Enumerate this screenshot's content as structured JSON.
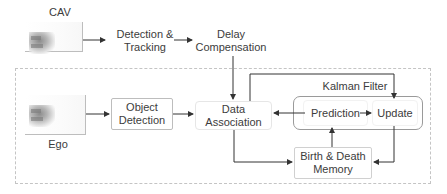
{
  "diagram": {
    "cav": {
      "label": "CAV",
      "image": "cav-point-cloud"
    },
    "ego": {
      "label": "Ego",
      "image": "ego-point-cloud"
    },
    "nodes": {
      "detection_tracking": "Detection &\nTracking",
      "delay_compensation": "Delay\nCompensation",
      "object_detection": "Object\nDetection",
      "data_association": "Data\nAssociation",
      "kalman_filter": "Kalman Filter",
      "prediction": "Prediction",
      "update": "Update",
      "birth_death_memory": "Birth & Death\nMemory"
    },
    "edges": [
      [
        "CAV",
        "Detection & Tracking"
      ],
      [
        "Detection & Tracking",
        "Delay Compensation"
      ],
      [
        "Delay Compensation",
        "Data Association"
      ],
      [
        "Ego",
        "Object Detection"
      ],
      [
        "Object Detection",
        "Data Association"
      ],
      [
        "Data Association",
        "Update"
      ],
      [
        "Prediction",
        "Data Association"
      ],
      [
        "Prediction",
        "Update"
      ],
      [
        "Data Association",
        "Birth & Death Memory"
      ],
      [
        "Update",
        "Birth & Death Memory"
      ],
      [
        "Birth & Death Memory",
        "Prediction"
      ]
    ],
    "colors": {
      "line": "#333333",
      "box_border": "#bdbdbd",
      "dashed_border": "#c4c4c4"
    }
  }
}
